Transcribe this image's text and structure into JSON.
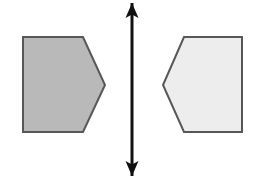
{
  "figure": {
    "background_color": "#ffffff",
    "width": 256,
    "height": 179
  },
  "shapes": [
    {
      "id": "left-hexagon",
      "label": "Left hexagon",
      "orientation": "point-right",
      "fill_color": "#b9b9b9",
      "stroke_color": "#575757",
      "stroke_width": 2,
      "points": "23,37 83,37 105,85 83,132 23,132"
    },
    {
      "id": "right-hexagon",
      "label": "Right hexagon",
      "orientation": "point-left",
      "fill_color": "#ededed",
      "stroke_color": "#575757",
      "stroke_width": 2,
      "points": "184,37 242,37 242,132 184,132 163,85"
    }
  ],
  "axis": {
    "id": "mirror-axis",
    "label": "Vertical mirror axis",
    "color": "#101010",
    "x": 132,
    "y_top": 3,
    "y_bottom": 176,
    "shaft_width": 3,
    "arrowhead_width": 13,
    "arrowhead_height": 15,
    "head_top_points": "132,3 138.5,18 132,14.5 125.5,18",
    "head_bottom_points": "132,176 125.5,161 132,164.5 138.5,161"
  }
}
